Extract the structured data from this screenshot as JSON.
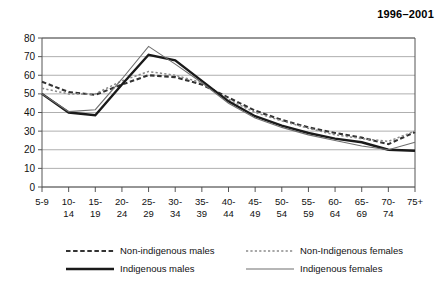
{
  "chart_data": {
    "type": "line",
    "title": "1996–2001",
    "xlabel": "",
    "ylabel": "",
    "ylim": [
      0,
      80
    ],
    "yticks": [
      0,
      10,
      20,
      30,
      40,
      50,
      60,
      70,
      80
    ],
    "grid": true,
    "legend_position": "bottom",
    "categories": [
      "5-9",
      "10-14",
      "15-19",
      "20-24",
      "25-29",
      "30-34",
      "35-39",
      "40-44",
      "45-49",
      "50-54",
      "55-59",
      "60-64",
      "65-69",
      "70-74",
      "75+"
    ],
    "series": [
      {
        "name": "Non-indigenous males",
        "style": "thick-dashed",
        "color": "#333333",
        "values": [
          56.5,
          51.0,
          49.5,
          55.0,
          60.0,
          59.0,
          55.0,
          48.0,
          41.0,
          36.0,
          32.0,
          29.0,
          26.5,
          23.0,
          29.5
        ]
      },
      {
        "name": "Non-Indigenous females",
        "style": "thin-dotted",
        "color": "#8a8a8a",
        "values": [
          53.0,
          50.0,
          50.0,
          57.0,
          62.0,
          60.0,
          56.0,
          47.0,
          40.0,
          35.5,
          31.5,
          28.0,
          26.0,
          24.5,
          30.0
        ]
      },
      {
        "name": "Indigenous males",
        "style": "thick-solid",
        "color": "#1a1a1a",
        "values": [
          50.0,
          40.0,
          38.5,
          55.0,
          71.0,
          68.0,
          57.0,
          46.0,
          38.0,
          33.0,
          29.0,
          26.0,
          24.0,
          20.0,
          19.5
        ]
      },
      {
        "name": "Indigenous females",
        "style": "thin-solid",
        "color": "#6e6e6e",
        "values": [
          50.0,
          40.5,
          41.5,
          58.0,
          75.5,
          66.0,
          56.0,
          45.0,
          37.0,
          32.0,
          28.0,
          25.0,
          22.0,
          20.0,
          24.0
        ]
      }
    ]
  },
  "legend": {
    "items": [
      {
        "label": "Non-indigenous males",
        "series_index": 0,
        "row": 0,
        "col": 0
      },
      {
        "label": "Non-Indigenous females",
        "series_index": 1,
        "row": 0,
        "col": 1
      },
      {
        "label": "Indigenous males",
        "series_index": 2,
        "row": 1,
        "col": 0
      },
      {
        "label": "Indigenous females",
        "series_index": 3,
        "row": 1,
        "col": 1
      }
    ]
  },
  "axes": {
    "y_tick_labels": [
      "0",
      "10",
      "20",
      "30",
      "40",
      "50",
      "60",
      "70",
      "80"
    ],
    "x_tick_labels_top": [
      "5-9",
      "10-",
      "15-",
      "20-",
      "25-",
      "30-",
      "35-",
      "40-",
      "45-",
      "50-",
      "55-",
      "60-",
      "65-",
      "70-",
      "75+"
    ],
    "x_tick_labels_bottom": [
      "",
      "14",
      "19",
      "24",
      "29",
      "34",
      "39",
      "44",
      "49",
      "54",
      "59",
      "64",
      "69",
      "74",
      ""
    ]
  }
}
